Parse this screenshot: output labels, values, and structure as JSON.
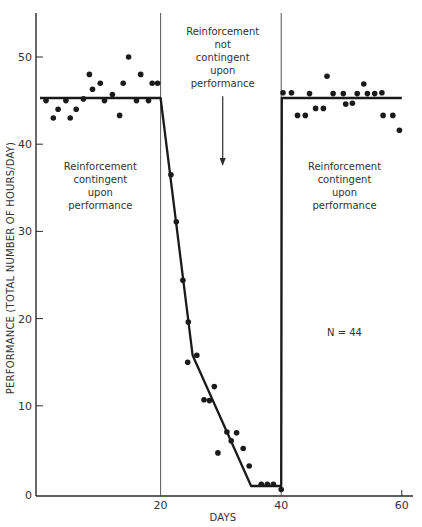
{
  "chart_data": {
    "type": "line",
    "title": "",
    "xlabel": "DAYS",
    "ylabel": "PERFORMANCE (TOTAL NUMBER OF HOURS/DAY)",
    "xlim": [
      0,
      60
    ],
    "ylim": [
      0,
      55
    ],
    "x_ticks": [
      20,
      40,
      60
    ],
    "y_ticks": [
      0,
      10,
      20,
      30,
      40,
      50
    ],
    "grid": false,
    "phase_boundaries": [
      20,
      40
    ],
    "annotations": [
      {
        "id": "phase1",
        "lines": [
          "Reinforcement",
          "contingent",
          "upon",
          "performance"
        ],
        "x": 10,
        "y": 37
      },
      {
        "id": "phase2",
        "lines": [
          "Reinforcement",
          "not",
          "contingent",
          "upon",
          "performance"
        ],
        "x": 30.3,
        "y": 52.5,
        "arrow": {
          "x": 30.3,
          "from_y": 45.5,
          "to_y": 37.5
        }
      },
      {
        "id": "phase3",
        "lines": [
          "Reinforcement",
          "contingent",
          "upon",
          "performance"
        ],
        "x": 50.5,
        "y": 37
      },
      {
        "id": "n_label",
        "lines": [
          "N = 44"
        ],
        "x": 50.5,
        "y": 18
      }
    ],
    "series": [
      {
        "name": "Daily performance",
        "kind": "scatter",
        "points": [
          [
            1,
            45
          ],
          [
            2.2,
            43
          ],
          [
            3,
            44
          ],
          [
            4.3,
            45
          ],
          [
            5,
            43
          ],
          [
            6,
            44
          ],
          [
            7.2,
            45.2
          ],
          [
            8.2,
            48
          ],
          [
            8.7,
            46.3
          ],
          [
            10,
            47
          ],
          [
            10.7,
            45
          ],
          [
            12,
            45.7
          ],
          [
            13.2,
            43.3
          ],
          [
            13.8,
            47
          ],
          [
            14.7,
            50
          ],
          [
            16,
            45
          ],
          [
            16.7,
            48
          ],
          [
            18,
            45
          ],
          [
            18.6,
            47
          ],
          [
            19.5,
            47
          ],
          [
            21.7,
            36.5
          ],
          [
            22.6,
            31.1
          ],
          [
            23.7,
            24.4
          ],
          [
            24.6,
            19.6
          ],
          [
            24.5,
            15
          ],
          [
            26,
            15.8
          ],
          [
            27.2,
            10.7
          ],
          [
            28.1,
            10.6
          ],
          [
            28.9,
            12.2
          ],
          [
            29.5,
            4.6
          ],
          [
            31,
            7
          ],
          [
            31.7,
            6
          ],
          [
            32.6,
            6.9
          ],
          [
            33.7,
            5.1
          ],
          [
            34.7,
            3.1
          ],
          [
            36.7,
            1
          ],
          [
            37.7,
            1
          ],
          [
            38.7,
            1
          ],
          [
            40,
            0.4
          ],
          [
            40.3,
            45.9
          ],
          [
            41.7,
            45.9
          ],
          [
            42.7,
            43.3
          ],
          [
            44,
            43.3
          ],
          [
            44.7,
            45.8
          ],
          [
            45.7,
            44.1
          ],
          [
            47,
            44.1
          ],
          [
            47.6,
            47.8
          ],
          [
            48.6,
            45.8
          ],
          [
            50.3,
            45.8
          ],
          [
            50.7,
            44.6
          ],
          [
            51.8,
            44.7
          ],
          [
            52.6,
            45.8
          ],
          [
            53.7,
            46.9
          ],
          [
            54.3,
            45.8
          ],
          [
            55.5,
            45.8
          ],
          [
            56.7,
            45.9
          ],
          [
            56.9,
            43.3
          ],
          [
            58.5,
            43.3
          ],
          [
            59.6,
            41.6
          ]
        ]
      },
      {
        "name": "Trend line",
        "kind": "line",
        "points": [
          [
            0,
            45.3
          ],
          [
            20,
            45.3
          ],
          [
            25.3,
            15.8
          ],
          [
            35,
            0.8
          ],
          [
            40,
            0.8
          ],
          [
            40.1,
            45.3
          ],
          [
            60,
            45.3
          ]
        ]
      }
    ]
  }
}
